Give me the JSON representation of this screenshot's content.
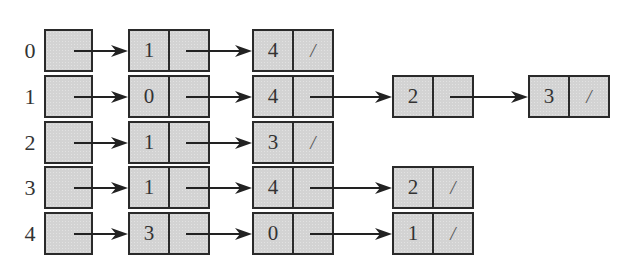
{
  "diagram": {
    "type": "adjacency-list",
    "null_marker": "/",
    "rows": [
      {
        "index": "0",
        "nodes": [
          "1",
          "4"
        ]
      },
      {
        "index": "1",
        "nodes": [
          "0",
          "4",
          "2",
          "3"
        ]
      },
      {
        "index": "2",
        "nodes": [
          "1",
          "3"
        ]
      },
      {
        "index": "3",
        "nodes": [
          "1",
          "4",
          "2"
        ]
      },
      {
        "index": "4",
        "nodes": [
          "3",
          "0",
          "1"
        ]
      }
    ]
  },
  "colors": {
    "box_fill": "#d3d3d3",
    "box_border": "#2a2a2a",
    "text": "#333333",
    "arrow": "#222222"
  }
}
